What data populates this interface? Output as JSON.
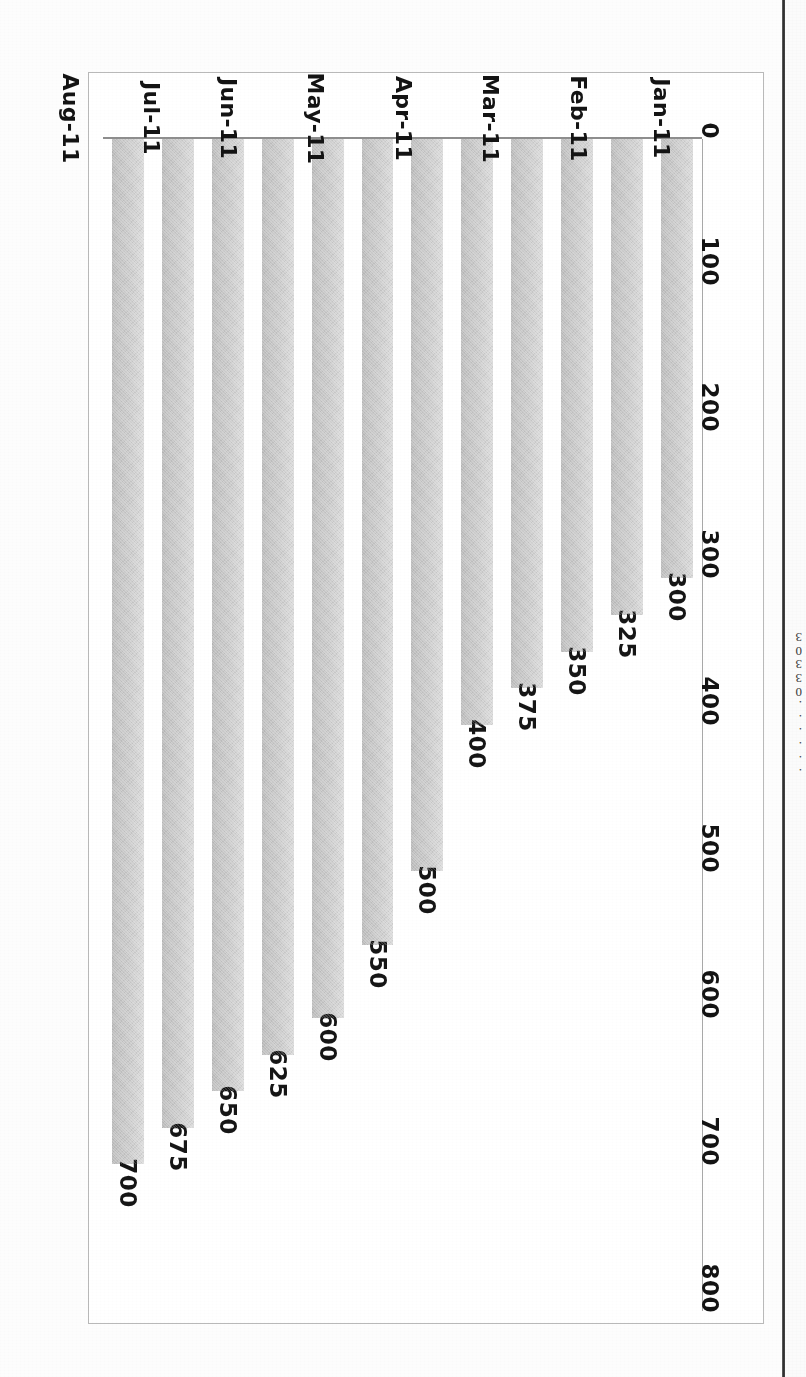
{
  "page": {
    "orientation_note": "rotated-180",
    "background_color": "#fdfdfd",
    "gutter_rule_color": "#2e2e2e"
  },
  "clipped_neighbour_text": [
    "3",
    "0",
    "3",
    "3",
    "0",
    ".",
    ".",
    ".",
    ".",
    ".",
    "."
  ],
  "chart_data": {
    "type": "bar",
    "title": "",
    "subtitle": "",
    "xlabel": "",
    "ylabel": "",
    "orientation": "vertical",
    "grid": false,
    "legend": false,
    "legend_position": "none",
    "bar_color": "#cfcfcf",
    "axis_color": "#8e8e8e",
    "frame_color": "#b9b9b9",
    "ylim": [
      0,
      800
    ],
    "ytick_labels": [
      "0",
      "100",
      "200",
      "300",
      "400",
      "500",
      "600",
      "700",
      "800"
    ],
    "yticks": [
      0,
      100,
      200,
      300,
      400,
      500,
      600,
      700,
      800
    ],
    "categories": [
      "Jan-11",
      "Feb-11",
      "Mar-11",
      "Apr-11",
      "May-11",
      "Jun-11",
      "Jul-11",
      "Aug-11",
      "Sep-11",
      "Oct-11",
      "Nov-11",
      "Dec-11"
    ],
    "values": [
      300,
      325,
      350,
      375,
      400,
      500,
      550,
      600,
      625,
      650,
      675,
      700
    ],
    "data_labels": [
      "300",
      "325",
      "350",
      "375",
      "400",
      "500",
      "550",
      "600",
      "625",
      "650",
      "675",
      "700"
    ]
  }
}
